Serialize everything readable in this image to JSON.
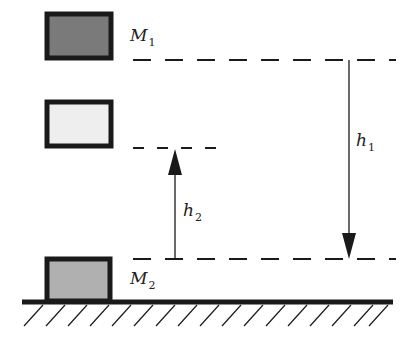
{
  "diagram": {
    "colors": {
      "m1_fill": "#7a7a7a",
      "intermediate_fill": "#eeeeee",
      "m2_fill": "#b0b0b0",
      "stroke": "#1a1a1a",
      "background": "#ffffff"
    },
    "blocks": [
      {
        "id": "m1",
        "label": "M",
        "subscript": "1"
      },
      {
        "id": "rebound",
        "label": "",
        "subscript": ""
      },
      {
        "id": "m2",
        "label": "M",
        "subscript": "2"
      }
    ],
    "heights": [
      {
        "id": "h1",
        "label": "h",
        "subscript": "1",
        "direction": "down"
      },
      {
        "id": "h2",
        "label": "h",
        "subscript": "2",
        "direction": "up"
      }
    ],
    "ground": {
      "hatched": true
    }
  }
}
